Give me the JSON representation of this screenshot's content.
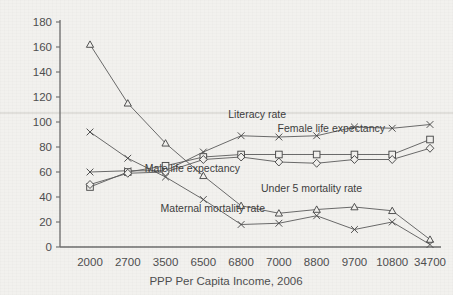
{
  "chart_data": {
    "type": "line",
    "title": "",
    "xlabel": "PPP Per Capita Income, 2006",
    "ylabel": "",
    "categories": [
      "2000",
      "2700",
      "3500",
      "6500",
      "6800",
      "7000",
      "8800",
      "9700",
      "10800",
      "34700"
    ],
    "ylim": [
      0,
      180
    ],
    "ytick_step": 20,
    "yticks": [
      "0",
      "20",
      "40",
      "60",
      "80",
      "100",
      "120",
      "140",
      "160",
      "180"
    ],
    "grid": false,
    "legend_position": "inline-annotations",
    "series": [
      {
        "name": "Under 5 mortality rate",
        "marker": "triangle",
        "values": [
          162,
          115,
          83,
          57,
          33,
          27,
          30,
          32,
          29,
          6
        ]
      },
      {
        "name": "Maternal mortality rate",
        "marker": "x",
        "values": [
          92,
          71,
          56,
          38,
          18,
          19,
          25,
          14,
          20,
          2
        ]
      },
      {
        "name": "Literacy rate",
        "marker": "x",
        "values": [
          60,
          61,
          61,
          76,
          89,
          88,
          89,
          96,
          95,
          98
        ]
      },
      {
        "name": "Female life expectancy",
        "marker": "square",
        "values": [
          48,
          60,
          65,
          72,
          74,
          74,
          74,
          74,
          74,
          86
        ]
      },
      {
        "name": "Male life expectancy",
        "marker": "diamond",
        "values": [
          50,
          59,
          60,
          70,
          72,
          68,
          67,
          70,
          70,
          79
        ]
      }
    ],
    "annotations": [
      {
        "text": "Literacy rate",
        "x": 286,
        "y": 118
      },
      {
        "text": "Female life expectancy",
        "x": 385,
        "y": 132
      },
      {
        "text": "Male life expectancy",
        "x": 240,
        "y": 172
      },
      {
        "text": "Under 5 mortality rate",
        "x": 362,
        "y": 192
      },
      {
        "text": "Maternal mortality rate",
        "x": 265,
        "y": 212
      }
    ]
  },
  "colors": {
    "background": "#f2f1ee",
    "axis": "#6b6b6b",
    "line": "#5a5a5a",
    "text": "#4a4a4a",
    "stray_gridline": "#cfcdc8"
  }
}
